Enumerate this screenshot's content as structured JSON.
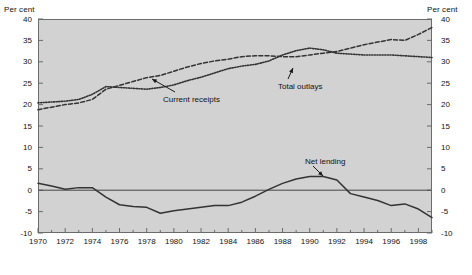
{
  "figure": {
    "axis_label_left": "Per cent",
    "axis_label_right": "Per cent",
    "plot_bg": "#d2d2d2",
    "page_bg": "#ffffff",
    "frame_color": "#6b6b6b",
    "series_color": "#333333"
  },
  "annotations": [
    {
      "name": "current-receipts",
      "text": "Current receipts"
    },
    {
      "name": "total-outlays",
      "text": "Total outlays"
    },
    {
      "name": "net-lending",
      "text": "Net lending"
    }
  ],
  "chart_data": {
    "type": "line",
    "title": "",
    "subtitle": "",
    "xlabel": "",
    "ylabel": "Per cent",
    "ylabel_right": "Per cent",
    "ylim": [
      -10,
      40
    ],
    "yticks": [
      -10,
      -5,
      0,
      5,
      10,
      15,
      20,
      25,
      30,
      35,
      40
    ],
    "xlim": [
      1970,
      1999
    ],
    "xticks": [
      1970,
      1972,
      1974,
      1976,
      1978,
      1980,
      1982,
      1984,
      1986,
      1988,
      1990,
      1992,
      1994,
      1996,
      1998
    ],
    "xticks_minor": [
      1971,
      1973,
      1975,
      1977,
      1979,
      1981,
      1983,
      1985,
      1987,
      1989,
      1991,
      1993,
      1995,
      1997,
      1999
    ],
    "grid": false,
    "legend_position": "inline-annotations",
    "zero_line": 0,
    "x": [
      1970,
      1971,
      1972,
      1973,
      1974,
      1975,
      1976,
      1977,
      1978,
      1979,
      1980,
      1981,
      1982,
      1983,
      1984,
      1985,
      1986,
      1987,
      1988,
      1989,
      1990,
      1991,
      1992,
      1993,
      1994,
      1995,
      1996,
      1997,
      1998,
      1999
    ],
    "series": [
      {
        "name": "Total outlays",
        "style": "dashed",
        "values": [
          18.8,
          19.4,
          20.0,
          20.4,
          21.2,
          23.6,
          24.5,
          25.4,
          26.3,
          26.8,
          27.8,
          28.8,
          29.6,
          30.2,
          30.6,
          31.2,
          31.4,
          31.4,
          31.2,
          31.2,
          31.6,
          32.0,
          32.4,
          33.2,
          34.0,
          34.6,
          35.2,
          35.0,
          36.4,
          38.0
        ]
      },
      {
        "name": "Current receipts",
        "style": "dotted",
        "values": [
          20.4,
          20.6,
          20.8,
          21.2,
          22.4,
          24.2,
          24.0,
          23.8,
          23.6,
          24.0,
          24.6,
          25.6,
          26.4,
          27.4,
          28.4,
          29.0,
          29.4,
          30.2,
          31.6,
          32.6,
          33.2,
          32.8,
          32.0,
          31.8,
          31.6,
          31.6,
          31.6,
          31.4,
          31.2,
          31.0
        ]
      },
      {
        "name": "Net lending",
        "style": "solid",
        "values": [
          1.6,
          1.0,
          0.2,
          0.6,
          0.6,
          -1.6,
          -3.4,
          -3.8,
          -4.0,
          -5.4,
          -4.8,
          -4.4,
          -4.0,
          -3.6,
          -3.6,
          -2.8,
          -1.4,
          0.2,
          1.6,
          2.6,
          3.2,
          3.2,
          2.4,
          -0.8,
          -1.6,
          -2.4,
          -3.6,
          -3.2,
          -4.4,
          -6.4
        ]
      }
    ]
  }
}
